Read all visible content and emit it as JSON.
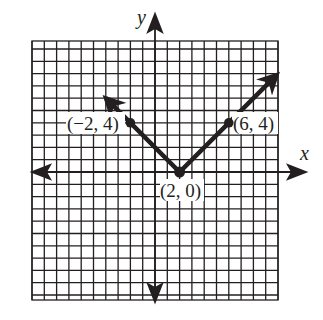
{
  "chart_data": {
    "type": "line",
    "title": "",
    "function": "y = |x - 2|",
    "xlabel": "x",
    "ylabel": "y",
    "grid": true,
    "xlim": [
      -10,
      10
    ],
    "ylim": [
      -10,
      11
    ],
    "series": [
      {
        "name": "y = |x - 2|",
        "x": [
          -4,
          -2,
          2,
          6,
          10
        ],
        "y": [
          6,
          4,
          0,
          4,
          8
        ],
        "arrows_at_ends": true
      }
    ],
    "labeled_points": [
      {
        "x": -2,
        "y": 4,
        "label": "(−2, 4)"
      },
      {
        "x": 2,
        "y": 0,
        "label": "(2, 0)"
      },
      {
        "x": 6,
        "y": 4,
        "label": "(6, 4)"
      }
    ]
  },
  "labels": {
    "x_axis": "x",
    "y_axis": "y",
    "point_a": "(−2, 4)",
    "point_b": "(2, 0)",
    "point_c": "(6, 4)"
  },
  "colors": {
    "ink": "#231f20",
    "background": "#ffffff"
  }
}
